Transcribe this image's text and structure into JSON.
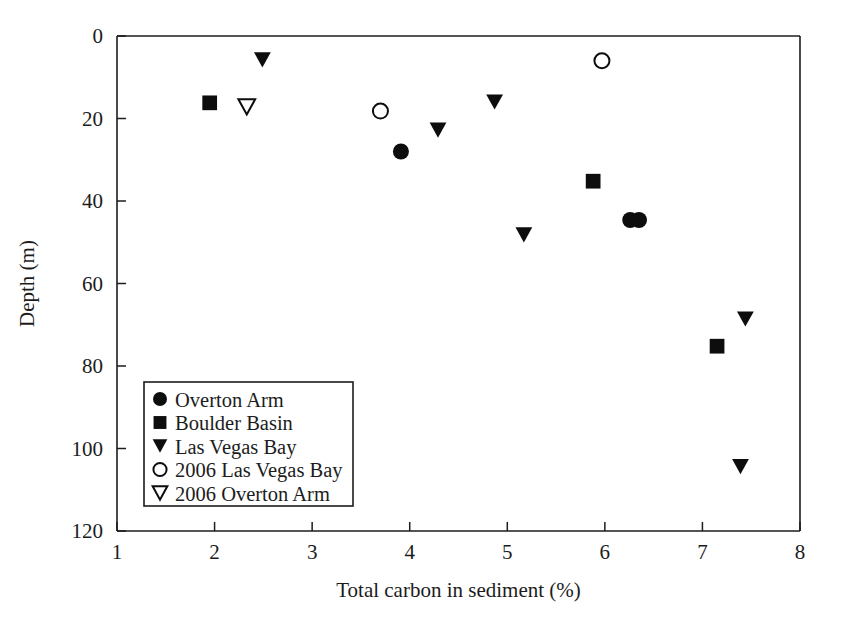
{
  "chart_data": {
    "type": "scatter",
    "title": "",
    "xlabel": "Total carbon in sediment (%)",
    "ylabel": "Depth (m)",
    "xlim": [
      1,
      8
    ],
    "ylim": [
      0,
      120
    ],
    "y_inverted": true,
    "grid": false,
    "legend_position": "lower-left-inside",
    "xticks": [
      1,
      2,
      3,
      4,
      5,
      6,
      7,
      8
    ],
    "xtick_labels": [
      "1",
      "2",
      "3",
      "4",
      "5",
      "6",
      "7",
      "8"
    ],
    "yticks": [
      0,
      20,
      40,
      60,
      80,
      100,
      120
    ],
    "ytick_labels": [
      "0",
      "20",
      "40",
      "60",
      "80",
      "100",
      "120"
    ],
    "series": [
      {
        "name": "Overton Arm",
        "marker": "filled-circle",
        "color": "#0d0d0d",
        "points": [
          {
            "x": 3.91,
            "y": 28.0
          },
          {
            "x": 6.26,
            "y": 44.6
          },
          {
            "x": 6.35,
            "y": 44.6
          }
        ]
      },
      {
        "name": "Boulder Basin",
        "marker": "filled-square",
        "color": "#0d0d0d",
        "points": [
          {
            "x": 1.95,
            "y": 16.2
          },
          {
            "x": 5.88,
            "y": 35.2
          },
          {
            "x": 7.15,
            "y": 75.2
          }
        ]
      },
      {
        "name": "Las Vegas Bay",
        "marker": "filled-triangle-down",
        "color": "#0d0d0d",
        "points": [
          {
            "x": 2.49,
            "y": 5.8
          },
          {
            "x": 4.29,
            "y": 22.8
          },
          {
            "x": 4.87,
            "y": 16.0
          },
          {
            "x": 5.17,
            "y": 48.2
          },
          {
            "x": 7.44,
            "y": 68.6
          },
          {
            "x": 7.39,
            "y": 104.4
          }
        ]
      },
      {
        "name": "2006 Las Vegas Bay",
        "marker": "open-circle",
        "color": "#0d0d0d",
        "points": [
          {
            "x": 3.7,
            "y": 18.2
          },
          {
            "x": 5.97,
            "y": 6.0
          }
        ]
      },
      {
        "name": "2006 Overton Arm",
        "marker": "open-triangle-down",
        "color": "#0d0d0d",
        "points": [
          {
            "x": 2.33,
            "y": 17.2
          }
        ]
      }
    ]
  },
  "legend": {
    "entries": [
      {
        "label": "Overton Arm",
        "marker": "filled-circle"
      },
      {
        "label": "Boulder Basin",
        "marker": "filled-square"
      },
      {
        "label": "Las Vegas Bay",
        "marker": "filled-triangle-down"
      },
      {
        "label": "2006 Las Vegas Bay",
        "marker": "open-circle"
      },
      {
        "label": "2006 Overton Arm",
        "marker": "open-triangle-down"
      }
    ]
  },
  "axes": {
    "x_title": "Total carbon in sediment (%)",
    "y_title": "Depth (m)"
  },
  "colors": {
    "ink": "#1c1c1c",
    "marker": "#0d0d0d",
    "background": "#ffffff"
  }
}
